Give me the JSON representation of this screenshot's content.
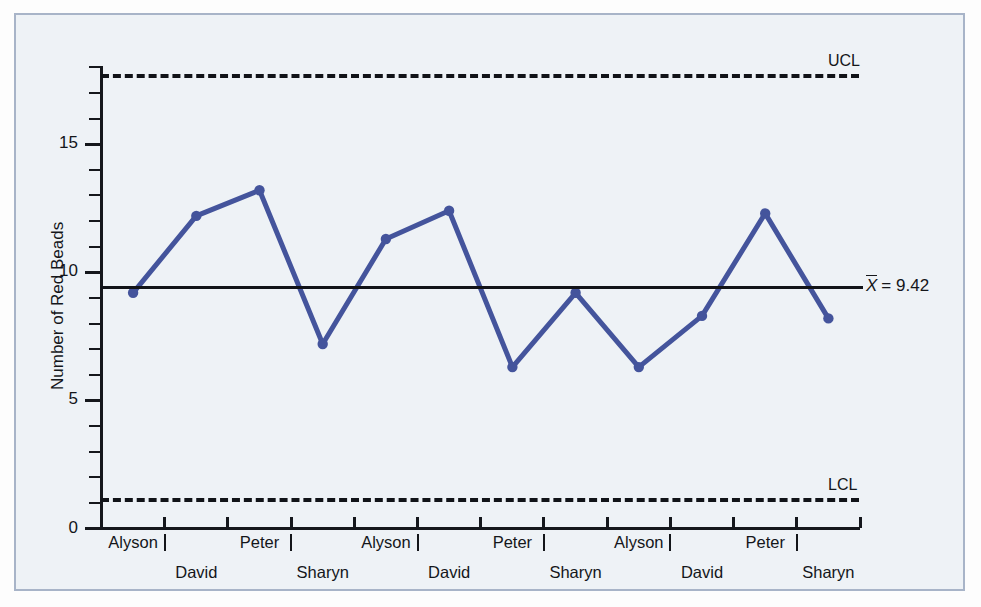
{
  "chart_data": {
    "type": "line",
    "title": "",
    "xlabel": "",
    "ylabel": "Number of Red Beads",
    "ylim": [
      0,
      18.5
    ],
    "yticks_major": [
      0,
      5,
      10,
      15
    ],
    "grid": false,
    "legend": "none",
    "categories": [
      "Alyson",
      "David",
      "Peter",
      "Sharyn",
      "Alyson",
      "David",
      "Peter",
      "Sharyn",
      "Alyson",
      "David",
      "Peter",
      "Sharyn"
    ],
    "values": [
      9.2,
      12.2,
      13.2,
      7.2,
      11.3,
      12.4,
      6.3,
      9.2,
      6.3,
      8.3,
      12.3,
      8.2
    ],
    "series": [
      {
        "name": "Number of Red Beads",
        "values": [
          9.2,
          12.2,
          13.2,
          7.2,
          11.3,
          12.4,
          6.3,
          9.2,
          6.3,
          8.3,
          12.3,
          8.2
        ],
        "color": "#44549c",
        "marker": "circle"
      }
    ],
    "reference_lines": [
      {
        "name": "UCL",
        "label": "UCL",
        "value": 17.75,
        "style": "dashed",
        "color": "#111318"
      },
      {
        "name": "center",
        "label": "X̄ = 9.42",
        "value": 9.42,
        "style": "solid",
        "color": "#111318"
      },
      {
        "name": "LCL",
        "label": "LCL",
        "value": 1.2,
        "style": "dashed",
        "color": "#111318"
      }
    ],
    "annotations": {
      "ucl_label": "UCL",
      "lcl_label": "LCL",
      "center_symbol": "X",
      "center_equals": "= 9.42",
      "center_value": 9.42
    }
  },
  "axes": {
    "y": {
      "title": "Number of Red Beads",
      "tick_labels": [
        "15",
        "10",
        "5",
        "0"
      ]
    },
    "x": {
      "row1_labels": [
        "Alyson",
        "Peter",
        "Alyson",
        "Peter",
        "Alyson",
        "Peter"
      ],
      "row2_labels": [
        "David",
        "Sharyn",
        "David",
        "Sharyn",
        "David",
        "Sharyn"
      ]
    }
  },
  "colors": {
    "series": "#44549c",
    "axis": "#15171c",
    "limits": "#111318",
    "plot_background": "#eef2f6",
    "frame_border": "#a8b4c8"
  }
}
